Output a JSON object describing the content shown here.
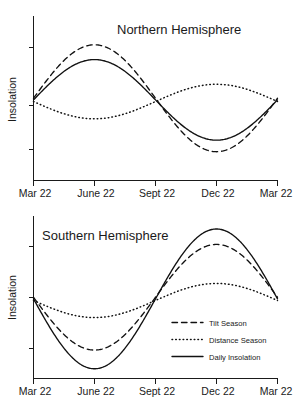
{
  "figure": {
    "width": 301,
    "height": 404,
    "background": "#ffffff",
    "ink_color": "#111111"
  },
  "panels": [
    {
      "id": "northern",
      "title": "Northern Hemisphere",
      "ylabel": "Insolation",
      "xticklabels": [
        "Mar 22",
        "June 22",
        "Sept 22",
        "Dec 22",
        "Mar 22"
      ],
      "legend_visible": false
    },
    {
      "id": "southern",
      "title": "Southern Hemisphere",
      "ylabel": "Insolation",
      "xticklabels": [
        "Mar 22",
        "June 22",
        "Sept 22",
        "Dec 22",
        "Mar 22"
      ],
      "legend_visible": true
    }
  ],
  "legend": {
    "position": "lower-right-inside",
    "entries": [
      {
        "label": "Tilt Season",
        "style": "dashed"
      },
      {
        "label": "Distance Season",
        "style": "dotted"
      },
      {
        "label": "Daily Insolation",
        "style": "solid"
      }
    ]
  },
  "chart_data": {
    "type": "line",
    "xlabel": "",
    "ylabel": "Insolation",
    "grid": false,
    "legend_position": "lower right (southern panel)",
    "x": [
      "Mar 22",
      "June 22",
      "Sept 22",
      "Dec 22",
      "Mar 22"
    ],
    "x_numeric": [
      0,
      0.25,
      0.5,
      0.75,
      1.0
    ],
    "xlim": [
      0,
      1
    ],
    "ylim": [
      0,
      1
    ],
    "y_axis_ticks_unlabeled": true,
    "x_tick_positions": [
      0,
      0.25,
      0.5,
      0.75,
      1.0
    ],
    "subplots": [
      {
        "panel": "Northern Hemisphere",
        "series": [
          {
            "name": "Tilt Season",
            "style": "dashed",
            "shape": "sine",
            "baseline": 0.5,
            "amplitude": 0.325,
            "phase_deg": 0,
            "note": "peaks at June 22, troughs at Dec 22",
            "samples_x": [
              0,
              0.125,
              0.25,
              0.375,
              0.5,
              0.625,
              0.75,
              0.875,
              1.0
            ],
            "samples_y": [
              0.5,
              0.73,
              0.825,
              0.73,
              0.5,
              0.27,
              0.175,
              0.27,
              0.5
            ]
          },
          {
            "name": "Distance Season",
            "style": "dotted",
            "shape": "sine",
            "baseline": 0.48,
            "amplitude": 0.105,
            "phase_deg": 180,
            "note": "troughs near June 22, peaks near Dec 22",
            "samples_x": [
              0,
              0.125,
              0.25,
              0.375,
              0.5,
              0.625,
              0.75,
              0.875,
              1.0
            ],
            "samples_y": [
              0.48,
              0.405,
              0.375,
              0.405,
              0.48,
              0.555,
              0.585,
              0.555,
              0.48
            ]
          },
          {
            "name": "Daily Insolation",
            "style": "solid",
            "shape": "sine",
            "baseline": 0.49,
            "amplitude": 0.245,
            "phase_deg": 0,
            "note": "sum of tilt and distance effects; peaks June 22, troughs Dec 22",
            "samples_x": [
              0,
              0.125,
              0.25,
              0.375,
              0.5,
              0.625,
              0.75,
              0.875,
              1.0
            ],
            "samples_y": [
              0.49,
              0.665,
              0.735,
              0.665,
              0.49,
              0.315,
              0.245,
              0.315,
              0.49
            ]
          }
        ]
      },
      {
        "panel": "Southern Hemisphere",
        "series": [
          {
            "name": "Tilt Season",
            "style": "dashed",
            "shape": "sine",
            "baseline": 0.5,
            "amplitude": 0.325,
            "phase_deg": 180,
            "note": "troughs at June 22, peaks at Dec 22",
            "samples_x": [
              0,
              0.125,
              0.25,
              0.375,
              0.5,
              0.625,
              0.75,
              0.875,
              1.0
            ],
            "samples_y": [
              0.5,
              0.27,
              0.175,
              0.27,
              0.5,
              0.73,
              0.825,
              0.73,
              0.5
            ]
          },
          {
            "name": "Distance Season",
            "style": "dotted",
            "shape": "sine",
            "baseline": 0.48,
            "amplitude": 0.105,
            "phase_deg": 180,
            "note": "troughs near June 22, peaks near Dec 22",
            "samples_x": [
              0,
              0.125,
              0.25,
              0.375,
              0.5,
              0.625,
              0.75,
              0.875,
              1.0
            ],
            "samples_y": [
              0.48,
              0.405,
              0.375,
              0.405,
              0.48,
              0.555,
              0.585,
              0.555,
              0.48
            ]
          },
          {
            "name": "Daily Insolation",
            "style": "solid",
            "shape": "sine",
            "baseline": 0.49,
            "amplitude": 0.43,
            "phase_deg": 180,
            "note": "tilt and distance reinforce; deepest trough June 22, highest peak Dec 22",
            "samples_x": [
              0,
              0.125,
              0.25,
              0.375,
              0.5,
              0.625,
              0.75,
              0.875,
              1.0
            ],
            "samples_y": [
              0.49,
              0.185,
              0.06,
              0.185,
              0.49,
              0.795,
              0.92,
              0.795,
              0.49
            ]
          }
        ]
      }
    ]
  }
}
